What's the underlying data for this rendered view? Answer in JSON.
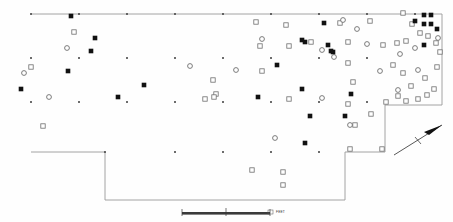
{
  "map": {
    "title": "Archaeological Site Plan",
    "background_color": "#fefefe",
    "outline_color": "#9a9a9a",
    "symbol_fill_dark": "#111111",
    "symbol_open_stroke": "#6d6d6d",
    "grid_point_color": "#4a4a4a"
  },
  "scale_bar": {
    "label": "FEET",
    "left_tick_label": "0",
    "mid_tick_label": "",
    "right_tick_label": "50",
    "units": "FEET"
  },
  "north_arrow": {
    "label": "",
    "direction": "north-east"
  },
  "legend": {
    "filled_square": "excavated feature",
    "open_square": "surface feature",
    "open_circle": "post mold",
    "grid_dot": "grid station"
  },
  "chart_data": {
    "type": "scatter",
    "xlabel": "",
    "ylabel": "",
    "xlim": [
      0,
      453
    ],
    "ylim": [
      0,
      222
    ],
    "grid": false,
    "legend_position": "none",
    "boundary": {
      "name": "excavation-outline",
      "points": [
        [
          31,
          14
        ],
        [
          442,
          14
        ],
        [
          442,
          105
        ],
        [
          385,
          105
        ],
        [
          385,
          152
        ],
        [
          345,
          152
        ],
        [
          345,
          200
        ],
        [
          105,
          200
        ],
        [
          105,
          152
        ],
        [
          31,
          152
        ]
      ]
    },
    "series": [
      {
        "name": "grid_stations",
        "symbol": "dot",
        "points": [
          [
            31,
            14
          ],
          [
            79,
            14
          ],
          [
            127,
            14
          ],
          [
            175,
            14
          ],
          [
            223,
            14
          ],
          [
            271,
            14
          ],
          [
            319,
            14
          ],
          [
            367,
            14
          ],
          [
            415,
            14
          ],
          [
            31,
            58
          ],
          [
            79,
            58
          ],
          [
            127,
            58
          ],
          [
            175,
            58
          ],
          [
            223,
            58
          ],
          [
            271,
            58
          ],
          [
            319,
            58
          ],
          [
            367,
            58
          ],
          [
            31,
            102
          ],
          [
            79,
            102
          ],
          [
            127,
            102
          ],
          [
            175,
            102
          ],
          [
            223,
            102
          ],
          [
            271,
            102
          ],
          [
            319,
            102
          ],
          [
            367,
            102
          ],
          [
            105,
            152
          ],
          [
            175,
            152
          ],
          [
            223,
            152
          ],
          [
            271,
            152
          ],
          [
            319,
            152
          ]
        ]
      },
      {
        "name": "filled_features",
        "symbol": "filled-square",
        "points": [
          [
            71,
            16
          ],
          [
            95,
            38
          ],
          [
            91,
            51
          ],
          [
            68,
            71
          ],
          [
            21,
            89
          ],
          [
            118,
            97
          ],
          [
            144,
            85
          ],
          [
            258,
            97
          ],
          [
            277,
            65
          ],
          [
            305,
            42
          ],
          [
            324,
            23
          ],
          [
            302,
            40
          ],
          [
            333,
            52
          ],
          [
            302,
            89
          ],
          [
            331,
            51
          ],
          [
            310,
            116
          ],
          [
            345,
            116
          ],
          [
            328,
            45
          ],
          [
            305,
            143
          ],
          [
            424,
            15
          ],
          [
            431,
            15
          ],
          [
            424,
            24
          ],
          [
            431,
            24
          ],
          [
            437,
            29
          ],
          [
            424,
            45
          ],
          [
            415,
            21
          ],
          [
            351,
            94
          ]
        ]
      },
      {
        "name": "open_squares",
        "symbol": "open-square",
        "points": [
          [
            74,
            32
          ],
          [
            31,
            67
          ],
          [
            43,
            126
          ],
          [
            216,
            94
          ],
          [
            205,
            99
          ],
          [
            256,
            22
          ],
          [
            286,
            25
          ],
          [
            260,
            46
          ],
          [
            289,
            46
          ],
          [
            262,
            71
          ],
          [
            311,
            42
          ],
          [
            340,
            23
          ],
          [
            348,
            42
          ],
          [
            370,
            21
          ],
          [
            348,
            63
          ],
          [
            353,
            82
          ],
          [
            383,
            45
          ],
          [
            289,
            99
          ],
          [
            348,
            104
          ],
          [
            371,
            114
          ],
          [
            355,
            125
          ],
          [
            403,
            13
          ],
          [
            412,
            24
          ],
          [
            406,
            41
          ],
          [
            397,
            43
          ],
          [
            420,
            33
          ],
          [
            428,
            36
          ],
          [
            436,
            43
          ],
          [
            393,
            65
          ],
          [
            403,
            73
          ],
          [
            425,
            78
          ],
          [
            411,
            86
          ],
          [
            434,
            89
          ],
          [
            398,
            96
          ],
          [
            427,
            95
          ],
          [
            440,
            52
          ],
          [
            437,
            67
          ],
          [
            418,
            99
          ],
          [
            406,
            101
          ],
          [
            252,
            170
          ],
          [
            283,
            172
          ],
          [
            283,
            185
          ],
          [
            350,
            149
          ],
          [
            382,
            149
          ],
          [
            214,
            97
          ],
          [
            213,
            80
          ],
          [
            386,
            102
          ]
        ]
      },
      {
        "name": "open_circles",
        "symbol": "open-circle",
        "points": [
          [
            24,
            73
          ],
          [
            67,
            48
          ],
          [
            49,
            97
          ],
          [
            190,
            66
          ],
          [
            236,
            70
          ],
          [
            262,
            39
          ],
          [
            334,
            57
          ],
          [
            322,
            98
          ],
          [
            322,
            50
          ],
          [
            367,
            44
          ],
          [
            380,
            71
          ],
          [
            400,
            54
          ],
          [
            418,
            70
          ],
          [
            398,
            90
          ],
          [
            415,
            48
          ],
          [
            350,
            125
          ],
          [
            275,
            138
          ],
          [
            343,
            20
          ],
          [
            357,
            29
          ],
          [
            438,
            38
          ]
        ]
      }
    ]
  }
}
